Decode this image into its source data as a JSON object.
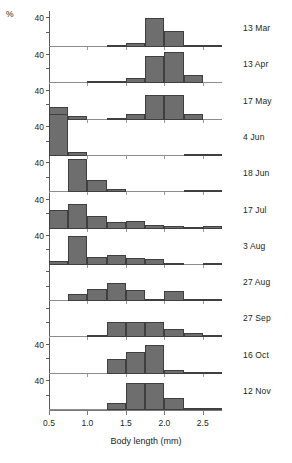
{
  "figure": {
    "percent_symbol": "%",
    "x_axis_title": "Body length (mm)",
    "x_tick_labels": [
      "0.5",
      "1.0",
      "1.5",
      "2.0",
      "2.5"
    ],
    "x_tick_values": [
      0.5,
      1.0,
      1.5,
      2.0,
      2.5
    ],
    "y_axis_label": "40",
    "bar_color": "#6e6e6e",
    "axis_color": "#5a5a5a"
  },
  "chart_data": {
    "type": "bar",
    "title": "",
    "xlabel": "Body length (mm)",
    "ylabel": "%",
    "xlim": [
      0.5,
      2.75
    ],
    "ylim": [
      0,
      50
    ],
    "bin_width": 0.25,
    "bin_starts": [
      0.5,
      0.75,
      1.0,
      1.25,
      1.5,
      1.75,
      2.0,
      2.25,
      2.5
    ],
    "grid": false,
    "legend": "none",
    "y_tick_values": [
      40
    ],
    "panels": [
      {
        "label": "13 Mar",
        "show_y_label": true,
        "values": [
          0,
          0,
          0,
          3,
          6,
          40,
          22,
          2,
          2
        ]
      },
      {
        "label": "13 Apr",
        "show_y_label": true,
        "values": [
          0,
          0,
          2,
          2,
          8,
          38,
          44,
          11,
          0
        ]
      },
      {
        "label": "17 May",
        "show_y_label": true,
        "values": [
          18,
          5,
          0,
          2,
          8,
          34,
          34,
          8,
          0
        ]
      },
      {
        "label": "4 Jun",
        "show_y_label": true,
        "values": [
          72,
          6,
          0,
          0,
          0,
          0,
          0,
          3,
          3
        ]
      },
      {
        "label": "18 Jun",
        "show_y_label": true,
        "values": [
          0,
          46,
          17,
          5,
          0,
          0,
          0,
          3,
          3
        ]
      },
      {
        "label": "17 Jul",
        "show_y_label": true,
        "values": [
          26,
          34,
          18,
          9,
          11,
          5,
          3,
          1,
          4
        ]
      },
      {
        "label": "3 Aug",
        "show_y_label": true,
        "values": [
          5,
          40,
          11,
          13,
          9,
          8,
          2,
          0,
          3
        ]
      },
      {
        "label": "27 Aug",
        "show_y_label": false,
        "values": [
          0,
          10,
          17,
          25,
          16,
          3,
          14,
          2,
          1
        ]
      },
      {
        "label": "27 Sep",
        "show_y_label": false,
        "values": [
          0,
          0,
          4,
          22,
          22,
          22,
          12,
          6,
          1
        ]
      },
      {
        "label": "16 Oct",
        "show_y_label": true,
        "values": [
          0,
          0,
          0,
          20,
          30,
          40,
          5,
          3,
          1
        ]
      },
      {
        "label": "12 Nov",
        "show_y_label": true,
        "values": [
          0,
          0,
          0,
          10,
          37,
          37,
          17,
          2,
          1
        ]
      }
    ]
  }
}
